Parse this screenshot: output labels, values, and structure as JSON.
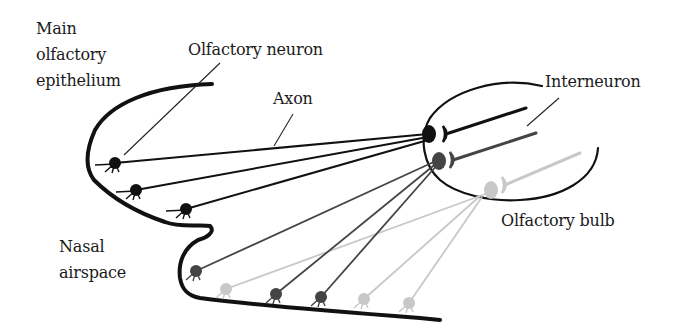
{
  "labels": {
    "main_olfactory_epithelium": "Main\nolfactory\nepithelium",
    "olfactory_neuron": "Olfactory neuron",
    "axon": "Axon",
    "interneuron": "Interneuron",
    "nasal_airspace": "Nasal\nairspace",
    "olfactory_bulb": "Olfactory bulb"
  },
  "colors": {
    "black": "#111111",
    "dark_gray": "#444444",
    "light_gray": "#c8c8c8"
  },
  "neurons": [
    {
      "cx": 115,
      "cy": 163,
      "shade": "black",
      "target": [
        428,
        134
      ]
    },
    {
      "cx": 136,
      "cy": 190,
      "shade": "black",
      "target": [
        428,
        137
      ]
    },
    {
      "cx": 186,
      "cy": 209,
      "shade": "black",
      "target": [
        428,
        140
      ]
    },
    {
      "cx": 196,
      "cy": 271,
      "shade": "dark_gray",
      "target": [
        438,
        160
      ]
    },
    {
      "cx": 226,
      "cy": 289,
      "shade": "light_gray",
      "target": [
        488,
        193
      ]
    },
    {
      "cx": 276,
      "cy": 294,
      "shade": "dark_gray",
      "target": [
        438,
        162
      ]
    },
    {
      "cx": 321,
      "cy": 297,
      "shade": "dark_gray",
      "target": [
        438,
        164
      ]
    },
    {
      "cx": 364,
      "cy": 299,
      "shade": "light_gray",
      "target": [
        480,
        196
      ]
    },
    {
      "cx": 409,
      "cy": 303,
      "shade": "light_gray",
      "target": [
        482,
        197
      ]
    }
  ],
  "glomeruli": [
    {
      "cx": 429,
      "cy": 134,
      "shade": "black"
    },
    {
      "cx": 439,
      "cy": 161,
      "shade": "dark_gray"
    },
    {
      "cx": 491,
      "cy": 190,
      "shade": "light_gray"
    }
  ],
  "interneurons": [
    {
      "x1": 446,
      "y1": 134,
      "x2": 526,
      "y2": 108,
      "shade": "black"
    },
    {
      "x1": 453,
      "y1": 160,
      "x2": 536,
      "y2": 133,
      "shade": "dark_gray"
    },
    {
      "x1": 505,
      "y1": 185,
      "x2": 580,
      "y2": 153,
      "shade": "light_gray"
    }
  ]
}
